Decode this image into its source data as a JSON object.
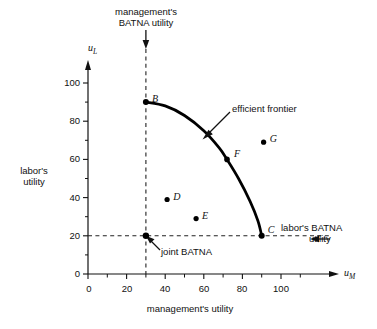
{
  "chart_data": {
    "type": "scatter",
    "title": "",
    "xlabel": "management's utility",
    "ylabel": "labor's utility",
    "x_axis_symbol": "u",
    "x_axis_subscript": "M",
    "y_axis_symbol": "u",
    "y_axis_subscript": "L",
    "xlim": [
      0,
      115
    ],
    "ylim": [
      0,
      112
    ],
    "x_ticks": [
      0,
      20,
      40,
      60,
      80,
      100
    ],
    "y_ticks": [
      0,
      20,
      40,
      60,
      80,
      100
    ],
    "x_minor_ticks": [
      10,
      30,
      50,
      70,
      90,
      110
    ],
    "y_minor_ticks": [
      10,
      30,
      50,
      70,
      90,
      110
    ],
    "grid": false,
    "legend": "none",
    "points": [
      {
        "label": "B",
        "x": 30,
        "y": 90,
        "on_frontier": true,
        "label_dx": 6,
        "label_dy": -9
      },
      {
        "label": "C",
        "x": 90,
        "y": 20,
        "on_frontier": true,
        "label_dx": 6,
        "label_dy": -12
      },
      {
        "label": "D",
        "x": 41,
        "y": 39,
        "on_frontier": false,
        "label_dx": 6,
        "label_dy": -9
      },
      {
        "label": "E",
        "x": 56,
        "y": 29,
        "on_frontier": false,
        "label_dx": 6,
        "label_dy": -9
      },
      {
        "label": "F",
        "x": 72,
        "y": 60,
        "on_frontier": true,
        "label_dx": 7,
        "label_dy": -11
      },
      {
        "label": "G",
        "x": 91,
        "y": 69,
        "on_frontier": false,
        "label_dx": 6,
        "label_dy": -9
      }
    ],
    "joint_batna_point": {
      "x": 30,
      "y": 20
    },
    "frontier": {
      "name": "efficient frontier",
      "description": "concave curve from B(30,90) through F(72,60) to C(90,20)",
      "path": [
        {
          "x": 30,
          "y": 90
        },
        {
          "x": 40,
          "y": 88
        },
        {
          "x": 50,
          "y": 83
        },
        {
          "x": 60,
          "y": 75
        },
        {
          "x": 68,
          "y": 66
        },
        {
          "x": 72,
          "y": 60
        },
        {
          "x": 78,
          "y": 50
        },
        {
          "x": 84,
          "y": 38
        },
        {
          "x": 88,
          "y": 28
        },
        {
          "x": 90,
          "y": 20
        }
      ]
    },
    "reference_lines": [
      {
        "name": "management's BATNA utility",
        "orientation": "vertical",
        "value": 30,
        "style": "dashed"
      },
      {
        "name": "labor's BATNA utility",
        "orientation": "horizontal",
        "value": 20,
        "style": "dashed"
      }
    ],
    "annotations": [
      {
        "name": "managements-batna-utility",
        "text_line1": "management's",
        "text_line2": "BATNA utility",
        "arrow": "down"
      },
      {
        "name": "efficient-frontier",
        "text": "efficient frontier",
        "arrow": "down-left"
      },
      {
        "name": "labors-batna-utility",
        "text_line1": "labor's BATNA",
        "text_line2": "utility",
        "arrow": "left"
      },
      {
        "name": "joint-batna",
        "text": "joint BATNA",
        "arrow": "up-left"
      }
    ]
  },
  "labels": {
    "top_annotation_line1": "management's",
    "top_annotation_line2": "BATNA utility",
    "y_axis_caption_line1": "labor's",
    "y_axis_caption_line2": "utility",
    "x_axis_caption": "management's utility",
    "efficient_frontier": "efficient frontier",
    "labors_batna_line1": "labor's BATNA",
    "labors_batna_line2": "utility",
    "joint_batna": "joint BATNA",
    "x_ticks": [
      "0",
      "20",
      "40",
      "60",
      "80",
      "100"
    ],
    "y_ticks": [
      "0",
      "20",
      "40",
      "60",
      "80",
      "100"
    ],
    "point_b": "B",
    "point_c": "C",
    "point_d": "D",
    "point_e": "E",
    "point_f": "F",
    "point_g": "G",
    "u_sym": "u",
    "sub_m": "M",
    "sub_l": "L"
  },
  "colors": {
    "ink": "#111111",
    "curve": "#000000",
    "dashed": "#222222",
    "background": "#ffffff"
  }
}
